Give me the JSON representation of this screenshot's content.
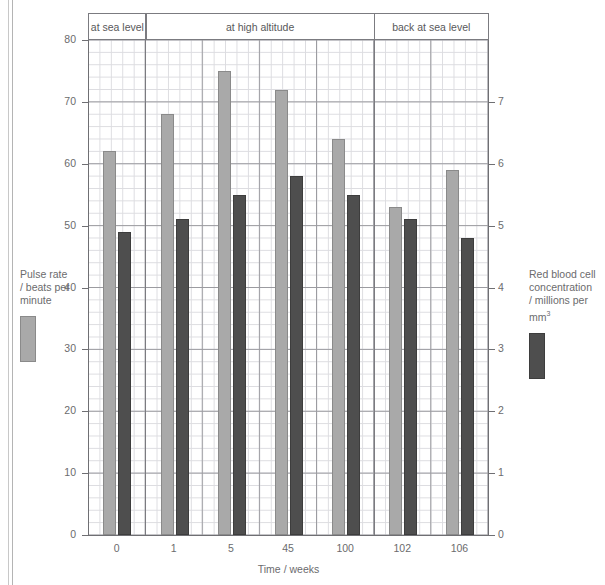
{
  "title": "",
  "chart_data": {
    "type": "bar",
    "title": "",
    "xlabel": "Time / weeks",
    "categories": [
      "0",
      "1",
      "5",
      "45",
      "100",
      "102",
      "106"
    ],
    "bands": [
      {
        "label": "at sea level",
        "categories": [
          "0"
        ]
      },
      {
        "label": "at high altitude",
        "categories": [
          "1",
          "5",
          "45",
          "100"
        ]
      },
      {
        "label": "back at sea level",
        "categories": [
          "102",
          "106"
        ]
      }
    ],
    "series": [
      {
        "name": "Pulse rate / beats per minute",
        "axis": "left",
        "color": "#a9a9a9",
        "unit": "beats per minute",
        "values": [
          62,
          68,
          75,
          72,
          64,
          53,
          59
        ]
      },
      {
        "name": "Red blood cell concentration / millions per mm³",
        "axis": "right",
        "color": "#4e4e4e",
        "unit": "millions per mm³",
        "values_left_scale": [
          49,
          51,
          55,
          58,
          55,
          51,
          48
        ],
        "values": [
          4.9,
          5.1,
          5.5,
          5.8,
          5.5,
          5.1,
          4.8
        ]
      }
    ],
    "y_left": {
      "label": "Pulse rate / beats per minute",
      "ticks": [
        0,
        10,
        20,
        30,
        40,
        50,
        60,
        70,
        80
      ],
      "lim": [
        0,
        80
      ],
      "tick_labels": [
        "0",
        "10",
        "20",
        "30",
        "40",
        "50",
        "60",
        "70",
        "80"
      ]
    },
    "y_right": {
      "label": "Red blood cell concentration / millions per mm³",
      "ticks": [
        0,
        1,
        2,
        3,
        4,
        5,
        6,
        7
      ],
      "lim": [
        0,
        8
      ],
      "tick_labels": [
        "0",
        "1",
        "2",
        "3",
        "4",
        "5",
        "6",
        "7"
      ]
    },
    "grid": true,
    "legend_position": "outside-left-and-right"
  },
  "legend": {
    "left": {
      "line1": "Pulse rate",
      "line2": "/ beats per",
      "line3": "minute",
      "swatch": "#a9a9a9"
    },
    "right": {
      "line1": "Red blood cell",
      "line2": "concentration",
      "line3": "/ millions per",
      "line4_pre": "mm",
      "line4_sup": "3",
      "swatch": "#4e4e4e"
    }
  }
}
